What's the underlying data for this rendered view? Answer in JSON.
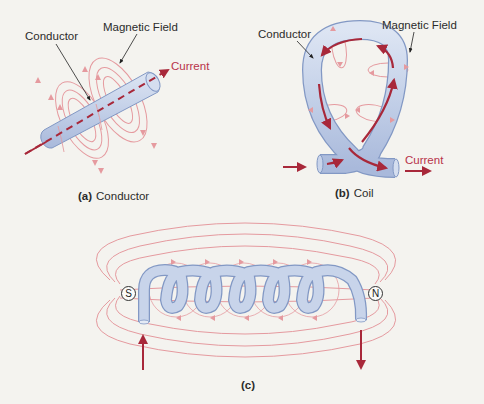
{
  "colors": {
    "background": "#f4f3ef",
    "field_line": "#e59a9f",
    "current": "#a8283a",
    "conductor_fill": "#c5d2e8",
    "conductor_stroke": "#8298c4",
    "text": "#2b2b2b",
    "current_label": "#b8324a"
  },
  "panel_a": {
    "conductor_label": "Conductor",
    "field_label": "Magnetic Field",
    "current_label": "Current",
    "caption_letter": "(a)",
    "caption_text": "Conductor"
  },
  "panel_b": {
    "conductor_label": "Conductor",
    "field_label": "Magnetic Field",
    "current_label": "Current",
    "caption_letter": "(b)",
    "caption_text": "Coil"
  },
  "panel_c": {
    "south_pole": "S",
    "north_pole": "N",
    "caption_letter": "(c)",
    "turns": 6
  }
}
